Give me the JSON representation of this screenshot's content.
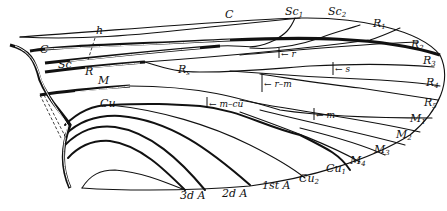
{
  "figure": {
    "type": "insect wing venation diagram",
    "labels": {
      "C_top": "C",
      "C_base": "C",
      "h": "h",
      "Sc": "Sc",
      "Sc1": "Sc",
      "Sc1_sub": "1",
      "Sc2": "Sc",
      "Sc2_sub": "2",
      "R": "R",
      "R1": "R",
      "R1_sub": "1",
      "R2": "R",
      "R2_sub": "2",
      "R3": "R",
      "R3_sub": "3",
      "R4": "R",
      "R4_sub": "4",
      "R5": "R",
      "R5_sub": "5",
      "Rs": "R",
      "Rs_sub": "s",
      "M": "M",
      "M1": "M",
      "M1_sub": "1",
      "M2": "M",
      "M2_sub": "2",
      "M3": "M",
      "M3_sub": "3",
      "M4": "M",
      "M4_sub": "4",
      "Cu": "Cu",
      "Cu1": "Cu",
      "Cu1_sub": "1",
      "Cu2": "Cu",
      "Cu2_sub": "2",
      "A1": "1st A",
      "A2": "2d A",
      "A3": "3d A",
      "cross_r": "← r",
      "cross_s": "← s",
      "cross_rm": "← r–m",
      "cross_mcu": "← m–cu",
      "cross_m": "← m"
    }
  }
}
